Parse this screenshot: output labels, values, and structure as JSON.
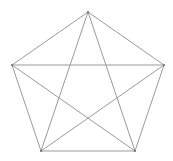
{
  "diagram": {
    "type": "complete-graph-pentagon",
    "stroke_color": "#9a9a9a",
    "vertex_color": "#6a6a6a",
    "vertices": [
      {
        "id": "top",
        "x": 88,
        "y": 12
      },
      {
        "id": "right",
        "x": 164,
        "y": 65
      },
      {
        "id": "bottom-right",
        "x": 135,
        "y": 151
      },
      {
        "id": "bottom-left",
        "x": 41,
        "y": 151
      },
      {
        "id": "left",
        "x": 12,
        "y": 65
      }
    ],
    "edges": [
      [
        "top",
        "right"
      ],
      [
        "right",
        "bottom-right"
      ],
      [
        "bottom-right",
        "bottom-left"
      ],
      [
        "bottom-left",
        "left"
      ],
      [
        "left",
        "top"
      ],
      [
        "top",
        "bottom-right"
      ],
      [
        "top",
        "bottom-left"
      ],
      [
        "left",
        "right"
      ],
      [
        "left",
        "bottom-right"
      ],
      [
        "right",
        "bottom-left"
      ]
    ]
  }
}
